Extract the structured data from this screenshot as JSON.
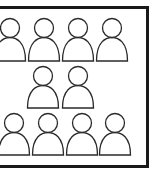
{
  "diagram": {
    "frame": {
      "stroke": "#1a1a1a",
      "fill": "#ffffff"
    },
    "icon_stroke": "#2a2a2a",
    "rows": [
      {
        "name": "top-row",
        "count": 4,
        "centers_x": [
          10,
          44,
          78,
          112
        ],
        "head_cy": 28,
        "base_y": 61
      },
      {
        "name": "middle-row",
        "count": 2,
        "centers_x": [
          43,
          78
        ],
        "head_cy": 76,
        "base_y": 108
      },
      {
        "name": "bottom-row",
        "count": 4,
        "centers_x": [
          14,
          48,
          82,
          115
        ],
        "head_cy": 123,
        "base_y": 155
      }
    ],
    "total_people": 10
  }
}
